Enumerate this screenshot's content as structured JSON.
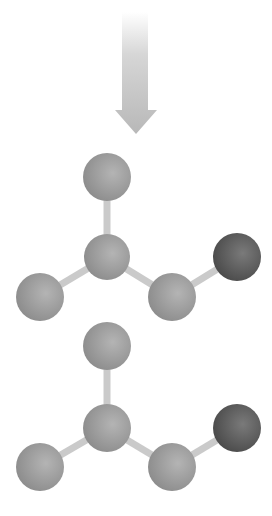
{
  "diagram": {
    "type": "reaction-scheme",
    "background": "#ffffff",
    "arrow": {
      "direction": "down",
      "color": "#bdbdbd",
      "shaft": {
        "x": 122,
        "width": 26,
        "top": 12,
        "bottom": 112
      },
      "head": {
        "left": 115,
        "right": 157,
        "top": 110,
        "tip_y": 134
      }
    },
    "colors": {
      "atom_light": "#b4b4b4",
      "atom_mid": "#8c8c8c",
      "atom_dark_light": "#7a7a7a",
      "atom_dark": "#4a4a4a",
      "bond": "#cacaca"
    },
    "molecules": [
      {
        "name": "molecule-1",
        "atoms": [
          {
            "id": "top",
            "x": 107,
            "y": 177,
            "r": 24,
            "kind": "light"
          },
          {
            "id": "center",
            "x": 107,
            "y": 257,
            "r": 23,
            "kind": "light"
          },
          {
            "id": "left",
            "x": 40,
            "y": 297,
            "r": 24,
            "kind": "light"
          },
          {
            "id": "right-middle",
            "x": 172,
            "y": 297,
            "r": 24,
            "kind": "light"
          },
          {
            "id": "right-dark",
            "x": 237,
            "y": 257,
            "r": 24,
            "kind": "dark"
          }
        ],
        "bonds": [
          [
            "top",
            "center"
          ],
          [
            "center",
            "left"
          ],
          [
            "center",
            "right-middle"
          ],
          [
            "right-middle",
            "right-dark"
          ]
        ]
      },
      {
        "name": "molecule-2",
        "atoms": [
          {
            "id": "top",
            "x": 107,
            "y": 346,
            "r": 24,
            "kind": "light"
          },
          {
            "id": "center",
            "x": 107,
            "y": 428,
            "r": 24,
            "kind": "light"
          },
          {
            "id": "left",
            "x": 40,
            "y": 467,
            "r": 24,
            "kind": "light"
          },
          {
            "id": "right-middle",
            "x": 172,
            "y": 467,
            "r": 24,
            "kind": "light"
          },
          {
            "id": "right-dark",
            "x": 237,
            "y": 428,
            "r": 24,
            "kind": "dark"
          }
        ],
        "bonds": [
          [
            "top",
            "center"
          ],
          [
            "center",
            "left"
          ],
          [
            "center",
            "right-middle"
          ],
          [
            "right-middle",
            "right-dark"
          ]
        ]
      }
    ],
    "caption": {
      "text": "",
      "note": "cropped at bottom edge; unreadable"
    }
  }
}
